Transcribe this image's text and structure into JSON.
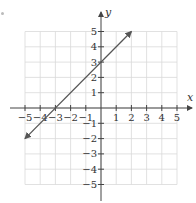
{
  "chart_data": {
    "type": "line",
    "title": "",
    "xlabel": "x",
    "ylabel": "y",
    "xlim": [
      -5,
      5
    ],
    "ylim": [
      -5,
      5
    ],
    "grid": true,
    "x_ticks": [
      -5,
      -4,
      -3,
      -2,
      -1,
      1,
      2,
      3,
      4,
      5
    ],
    "y_ticks": [
      -5,
      -4,
      -3,
      -2,
      -1,
      1,
      2,
      3,
      4,
      5
    ],
    "x_tick_labels": [
      "−5",
      "−4",
      "−3",
      "−2",
      "−1",
      "1",
      "2",
      "3",
      "4",
      "5"
    ],
    "y_tick_labels": [
      "−5",
      "−4",
      "−3",
      "−2",
      "−1",
      "1",
      "2",
      "3",
      "4",
      "5"
    ],
    "series": [
      {
        "name": "y = x + 3",
        "equation": "y = x + 3",
        "x": [
          -5,
          2
        ],
        "y": [
          -2,
          5
        ],
        "arrows": "both",
        "color": "#555555"
      }
    ],
    "intercepts": {
      "x_intercept": [
        -3,
        0
      ],
      "y_intercept": [
        0,
        3
      ]
    }
  },
  "colors": {
    "grid": "#d9d9d9",
    "axis": "#444444",
    "line": "#555555",
    "text": "#333333"
  }
}
